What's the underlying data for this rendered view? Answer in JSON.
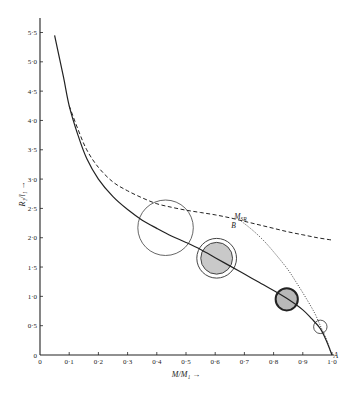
{
  "chart_data": {
    "type": "line",
    "title": "",
    "xlabel": "M/M₁ →",
    "ylabel": "R₁/l₁ →",
    "xlim": [
      0,
      1.0
    ],
    "ylim": [
      0,
      5.5
    ],
    "grid": false,
    "x_ticks": [
      "0",
      "0·1",
      "0·2",
      "0·3",
      "0·4",
      "0·5",
      "0·6",
      "0·7",
      "0·8",
      "0·9",
      "1·0"
    ],
    "x_tick_values": [
      0,
      0.1,
      0.2,
      0.3,
      0.4,
      0.5,
      0.6,
      0.7,
      0.8,
      0.9,
      1.0
    ],
    "y_ticks": [
      "0",
      "0·5",
      "1·0",
      "1·5",
      "2·0",
      "2·5",
      "3·0",
      "3·5",
      "4·0",
      "4·5",
      "5·0",
      "5·5"
    ],
    "y_tick_values": [
      0,
      0.5,
      1.0,
      1.5,
      2.0,
      2.5,
      3.0,
      3.5,
      4.0,
      4.5,
      5.0,
      5.5
    ],
    "series": [
      {
        "name": "solid",
        "style": "solid",
        "x": [
          0.05,
          0.08,
          0.1,
          0.13,
          0.16,
          0.2,
          0.25,
          0.3,
          0.35,
          0.4,
          0.45,
          0.5,
          0.55,
          0.6,
          0.65,
          0.7,
          0.75,
          0.8,
          0.85,
          0.9,
          0.93,
          0.96,
          0.98,
          1.0
        ],
        "y": [
          5.45,
          4.75,
          4.25,
          3.75,
          3.35,
          3.0,
          2.7,
          2.48,
          2.3,
          2.16,
          2.03,
          1.92,
          1.8,
          1.66,
          1.52,
          1.38,
          1.24,
          1.1,
          0.95,
          0.77,
          0.62,
          0.45,
          0.25,
          0.0
        ]
      },
      {
        "name": "dashed",
        "style": "dashed",
        "x": [
          0.1,
          0.13,
          0.16,
          0.2,
          0.25,
          0.3,
          0.35,
          0.4,
          0.45,
          0.5,
          0.55,
          0.6,
          0.65,
          0.7,
          0.75,
          0.8,
          0.85,
          0.9,
          0.95,
          1.0
        ],
        "y": [
          4.25,
          3.85,
          3.5,
          3.2,
          2.95,
          2.8,
          2.68,
          2.58,
          2.52,
          2.47,
          2.43,
          2.39,
          2.34,
          2.28,
          2.22,
          2.16,
          2.1,
          2.05,
          2.0,
          1.96
        ]
      },
      {
        "name": "dotted",
        "style": "dotted",
        "x": [
          0.69,
          0.73,
          0.77,
          0.81,
          0.85,
          0.88,
          0.91,
          0.94,
          0.96,
          0.98,
          0.99,
          1.0
        ],
        "y": [
          2.28,
          2.12,
          1.93,
          1.7,
          1.45,
          1.22,
          0.98,
          0.72,
          0.5,
          0.28,
          0.14,
          0.0
        ]
      }
    ],
    "circles": [
      {
        "name": "large-open-circle",
        "cx": 0.43,
        "cy": 2.17,
        "r": 0.095,
        "fill": "none",
        "stroke": "#555",
        "ring": false
      },
      {
        "name": "shaded-double-circle",
        "cx": 0.605,
        "cy": 1.65,
        "r": 0.068,
        "fill": "#c9c9c9",
        "stroke": "#444",
        "ring": true
      },
      {
        "name": "dark-rim-circle",
        "cx": 0.845,
        "cy": 0.95,
        "r": 0.038,
        "fill": "#b8b8b8",
        "stroke": "#222",
        "ring": false
      },
      {
        "name": "small-open-circle",
        "cx": 0.96,
        "cy": 0.48,
        "r": 0.023,
        "fill": "none",
        "stroke": "#444",
        "ring": false
      }
    ],
    "annotations": [
      {
        "name": "label-msr",
        "text": "M",
        "sub": "SR",
        "x": 0.665,
        "y": 2.32
      },
      {
        "name": "label-b",
        "text": "B",
        "x": 0.655,
        "y": 2.16
      },
      {
        "name": "label-a",
        "text": "A",
        "x": 1.005,
        "y": -0.05
      }
    ]
  }
}
